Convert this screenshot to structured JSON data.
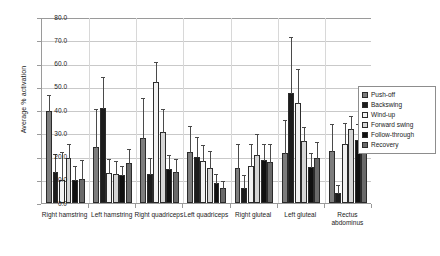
{
  "chart_data": {
    "type": "bar",
    "title": "",
    "xlabel": "",
    "ylabel": "Average % activation",
    "ylim": [
      0,
      80
    ],
    "ytick_labels": [
      "80.0",
      "70.0",
      "60.0",
      "50.0",
      "40.0",
      "30.0",
      "20.0",
      "10.0",
      "0.0"
    ],
    "ytick_values": [
      80,
      70,
      60,
      50,
      40,
      30,
      20,
      10,
      0
    ],
    "grid": true,
    "legend_position": "right",
    "error_bars": "upper-only",
    "categories": [
      "Right hamstring",
      "Left hamstring",
      "Right quadriceps",
      "Left quadriceps",
      "Right gluteal",
      "Left gluteal",
      "Rectus\nabdominus"
    ],
    "series": [
      {
        "name": "Push-off",
        "color": "#7d7d7d",
        "values": [
          39.5,
          24.0,
          28.0,
          22.0,
          15.0,
          21.5,
          22.5
        ],
        "errors": [
          7.5,
          17.0,
          17.5,
          11.5,
          11.0,
          14.5,
          12.0
        ]
      },
      {
        "name": "Backswing",
        "color": "#1c1c1c",
        "values": [
          13.5,
          41.0,
          12.5,
          20.0,
          6.5,
          47.5,
          4.5
        ],
        "errors": [
          8.0,
          13.5,
          7.5,
          9.0,
          6.0,
          24.5,
          3.5
        ]
      },
      {
        "name": "Wind-up",
        "color": "#f2f2f2",
        "values": [
          10.0,
          13.0,
          52.0,
          18.0,
          16.0,
          43.0,
          25.5
        ],
        "errors": [
          12.5,
          6.5,
          9.0,
          7.5,
          10.0,
          15.0,
          9.5
        ]
      },
      {
        "name": "Forward swing",
        "color": "#d5d5d5",
        "values": [
          19.5,
          12.5,
          30.5,
          15.0,
          20.5,
          26.5,
          32.0
        ],
        "errors": [
          6.5,
          6.0,
          10.5,
          8.0,
          9.5,
          6.5,
          6.0
        ]
      },
      {
        "name": "Follow-through",
        "color": "#101010",
        "values": [
          10.0,
          12.0,
          14.5,
          8.5,
          18.5,
          15.5,
          27.0
        ],
        "errors": [
          6.5,
          4.5,
          6.5,
          4.5,
          7.5,
          6.5,
          7.5
        ]
      },
      {
        "name": "Recovery",
        "color": "#6a6a6a",
        "values": [
          10.5,
          17.0,
          13.5,
          6.5,
          17.5,
          19.5,
          23.0
        ],
        "errors": [
          8.5,
          6.5,
          6.0,
          3.5,
          8.5,
          7.0,
          6.5
        ]
      }
    ]
  },
  "legend": {
    "items": [
      {
        "label": "Push-off"
      },
      {
        "label": "Backswing"
      },
      {
        "label": "Wind-up"
      },
      {
        "label": "Forward swing"
      },
      {
        "label": "Follow-through"
      },
      {
        "label": "Recovery"
      }
    ]
  }
}
